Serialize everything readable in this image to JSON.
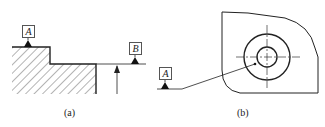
{
  "figure_a": {
    "caption": "(a)",
    "datum_labels": [
      "A",
      "B"
    ]
  },
  "figure_b": {
    "caption": "(b)",
    "datum_labels": [
      "A"
    ]
  },
  "colors": {
    "line": "#222222",
    "hatch": "#444444",
    "background": "#ffffff"
  }
}
